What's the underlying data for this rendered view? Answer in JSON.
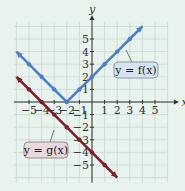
{
  "chart_data": {
    "type": "line",
    "title": "",
    "xlabel": "x",
    "ylabel": "y",
    "xlim": [
      -6,
      6
    ],
    "ylim": [
      -6,
      6
    ],
    "grid": true,
    "x_ticks": [
      "-5",
      "-4",
      "-3",
      "-2",
      "-1",
      "1",
      "2",
      "3",
      "4",
      "5"
    ],
    "y_ticks": [
      "5",
      "4",
      "3",
      "2",
      "1",
      "-1",
      "-2",
      "-3",
      "-4",
      "-5"
    ],
    "series": [
      {
        "name": "y = f(x)",
        "color": "#4f7fc0",
        "points": [
          [
            -6,
            4
          ],
          [
            -5,
            3
          ],
          [
            -4,
            2
          ],
          [
            -3,
            1
          ],
          [
            -2,
            0
          ],
          [
            -1,
            1
          ],
          [
            0,
            2
          ],
          [
            1,
            3
          ],
          [
            2,
            4
          ],
          [
            3,
            5
          ],
          [
            4,
            6
          ]
        ]
      },
      {
        "name": "y = g(x)",
        "color": "#7a1f2b",
        "points": [
          [
            -6,
            2
          ],
          [
            -5,
            1
          ],
          [
            -4,
            0
          ],
          [
            -3,
            -1
          ],
          [
            -2,
            -2
          ],
          [
            -1,
            -3
          ],
          [
            0,
            -4
          ],
          [
            1,
            -5
          ],
          [
            2,
            -6
          ]
        ]
      }
    ],
    "annotations": [
      "y = f(x)",
      "y = g(x)"
    ]
  },
  "labels": {
    "f": "y = f(x)",
    "g": "y = g(x)",
    "x_axis": "x",
    "y_axis": "y"
  }
}
